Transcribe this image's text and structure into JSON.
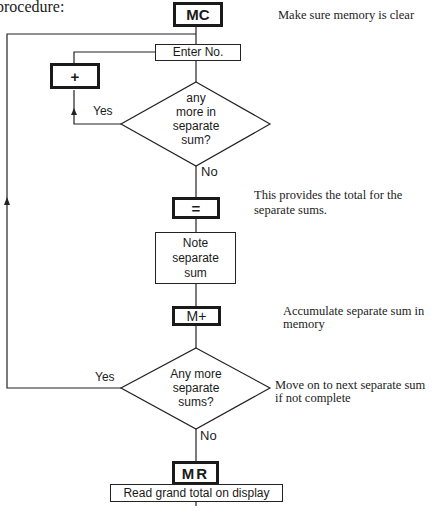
{
  "heading": "procedure:",
  "flowchart": {
    "keys": {
      "mc": "MC",
      "plus": "+",
      "equals": "=",
      "m_plus": "M+",
      "mr": "MR"
    },
    "steps": {
      "enter_no": "Enter No.",
      "note_sum_1": "Note",
      "note_sum_2": "separate",
      "note_sum_3": "sum",
      "read_total": "Read grand total on display"
    },
    "decisions": {
      "first": {
        "line1": "any",
        "line2": "more in",
        "line3": "separate",
        "line4": "sum?",
        "yes": "Yes",
        "no": "No"
      },
      "second": {
        "line1": "Any more",
        "line2": "separate",
        "line3": "sums?",
        "yes": "Yes",
        "no": "No"
      }
    },
    "notes": {
      "mc": "Make sure memory is clear",
      "equals_1": "This provides the total for the",
      "equals_2": "separate sums.",
      "m_plus_1": "Accumulate separate sum in",
      "m_plus_2": "memory",
      "decision2_1": "Move on to next separate sum",
      "decision2_2": "if not complete"
    }
  }
}
